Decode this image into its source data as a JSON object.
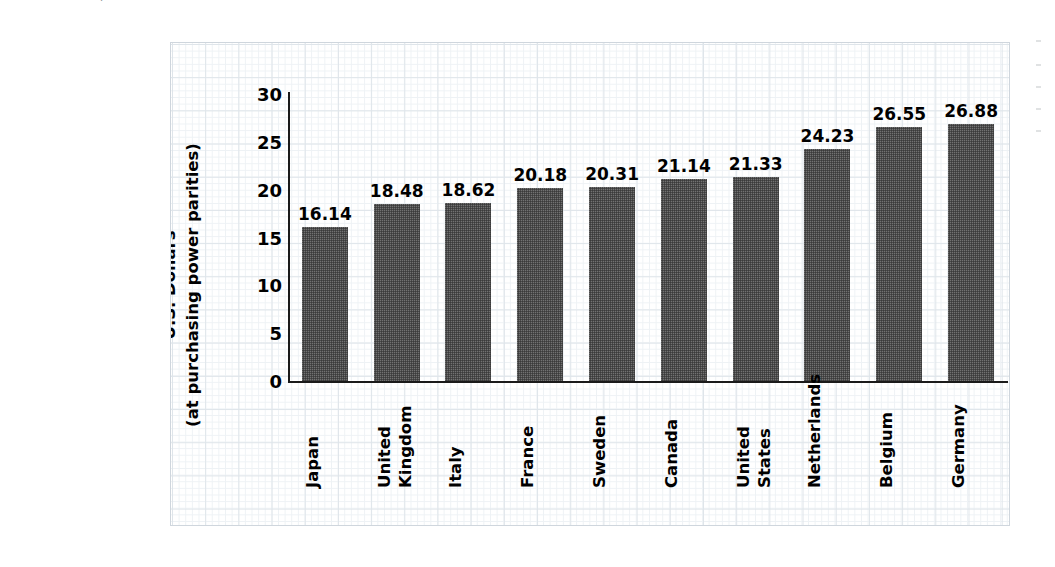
{
  "source_note": {
    "label": "source-note",
    "segments": [
      {
        "text": "SOURCE: U.S. Department of Labor, Bureau of Labor Statistics, http://www.bls.gov; and Organization for Economic Co-operation and Development, ",
        "italic": false
      },
      {
        "text": "National Accounts of OECD Countries, Main Aggregates",
        "italic": true
      },
      {
        "text": ", http://new.sourceoecd.org, accessed September 2004.",
        "italic": false
      }
    ],
    "plain": "SOURCE: U.S. Department of Labor, Bureau of Labor Statistics, http://www.bls.gov; and Organization for Economic Co-operation and Development, National Accounts of OECD Countries, Main Aggregates, http://new.sourceoecd.org, accessed September 2004."
  },
  "axis": {
    "y_title_line1": "U.S. Dollars",
    "y_title_line2": "(at purchasing power parities)",
    "y_ticks": [
      "0",
      "5",
      "10",
      "15",
      "20",
      "25",
      "30"
    ]
  },
  "colors": {
    "bar_fill": "#4a4a4a",
    "grid_major": "#dfe5ea",
    "grid_minor": "#eef2f5",
    "axis": "#1a1a1a",
    "text": "#000000"
  },
  "chart_data": {
    "type": "bar",
    "title": "",
    "subtitle": "",
    "xlabel": "",
    "ylabel": "U.S. Dollars (at purchasing power parities)",
    "ylim": [
      0,
      30
    ],
    "ytick_step": 5,
    "grid": true,
    "legend": false,
    "orientation": "vertical",
    "value_labels": true,
    "categories": [
      "Japan",
      "United Kingdom",
      "Italy",
      "France",
      "Sweden",
      "Canada",
      "United States",
      "Netherlands",
      "Belgium",
      "Germany"
    ],
    "category_lines": [
      [
        "Japan"
      ],
      [
        "United",
        "Kingdom"
      ],
      [
        "Italy"
      ],
      [
        "France"
      ],
      [
        "Sweden"
      ],
      [
        "Canada"
      ],
      [
        "United",
        "States"
      ],
      [
        "Netherlands"
      ],
      [
        "Belgium"
      ],
      [
        "Germany"
      ]
    ],
    "values": [
      16.14,
      18.48,
      18.62,
      20.18,
      20.31,
      21.14,
      21.33,
      24.23,
      26.55,
      26.88
    ],
    "value_text": [
      "16.14",
      "18.48",
      "18.62",
      "20.18",
      "20.31",
      "21.14",
      "21.33",
      "24.23",
      "26.55",
      "26.88"
    ]
  }
}
